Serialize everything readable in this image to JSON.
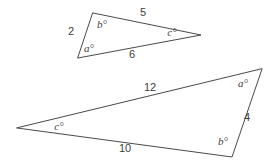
{
  "figure": {
    "background_color": "#ffffff",
    "stroke_color": "#4a4a4a",
    "text_color": "#3d3d3d",
    "triangles": [
      {
        "name": "small-triangle",
        "vertices": [
          {
            "name": "top-left-vertex",
            "x": 93,
            "y": 13
          },
          {
            "name": "right-vertex",
            "x": 201,
            "y": 35
          },
          {
            "name": "bottom-left-vertex",
            "x": 78,
            "y": 58
          }
        ],
        "side_labels": [
          {
            "name": "side-label-5",
            "text": "5",
            "x": 143,
            "y": 13
          },
          {
            "name": "side-label-6",
            "text": "6",
            "x": 132,
            "y": 55
          },
          {
            "name": "side-label-2",
            "text": "2",
            "x": 71,
            "y": 32
          }
        ],
        "angle_labels": [
          {
            "name": "angle-label-b",
            "text": "b°",
            "x": 102,
            "y": 25
          },
          {
            "name": "angle-label-a",
            "text": "a°",
            "x": 89,
            "y": 49
          },
          {
            "name": "angle-label-c",
            "text": "c°",
            "x": 172,
            "y": 33
          }
        ]
      },
      {
        "name": "large-triangle",
        "vertices": [
          {
            "name": "top-right-vertex",
            "x": 262,
            "y": 69
          },
          {
            "name": "bottom-right-vertex",
            "x": 232,
            "y": 157
          },
          {
            "name": "left-vertex",
            "x": 17,
            "y": 128
          }
        ],
        "side_labels": [
          {
            "name": "side-label-12",
            "text": "12",
            "x": 150,
            "y": 88
          },
          {
            "name": "side-label-4",
            "text": "4",
            "x": 247,
            "y": 118
          },
          {
            "name": "side-label-10",
            "text": "10",
            "x": 125,
            "y": 149
          }
        ],
        "angle_labels": [
          {
            "name": "angle-label-a",
            "text": "a°",
            "x": 243,
            "y": 84
          },
          {
            "name": "angle-label-b",
            "text": "b°",
            "x": 223,
            "y": 142
          },
          {
            "name": "angle-label-c",
            "text": "c°",
            "x": 59,
            "y": 127
          }
        ]
      }
    ]
  }
}
